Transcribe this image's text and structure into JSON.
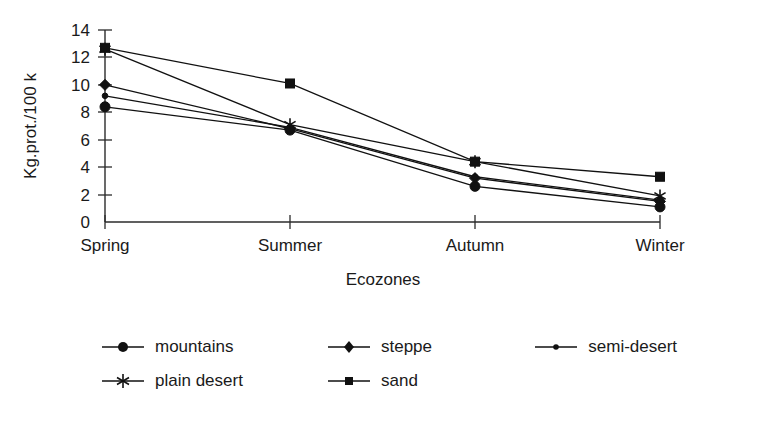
{
  "chart_data": {
    "type": "line",
    "title": "",
    "xlabel": "Ecozones",
    "ylabel": "Kg.prot./100 k",
    "categories": [
      "Spring",
      "Summer",
      "Autumn",
      "Winter"
    ],
    "ylim": [
      0,
      14
    ],
    "yticks": [
      0,
      2,
      4,
      6,
      8,
      10,
      12,
      14
    ],
    "ytick_labels": [
      "0",
      "2",
      "4",
      "6",
      "8",
      "10",
      "12",
      "14"
    ],
    "grid": false,
    "legend_position": "bottom",
    "series": [
      {
        "name": "mountains",
        "marker": "circle",
        "values": [
          8.4,
          6.7,
          2.6,
          1.1
        ]
      },
      {
        "name": "steppe",
        "marker": "diamond",
        "values": [
          10.0,
          6.8,
          3.2,
          1.5
        ]
      },
      {
        "name": "semi-desert",
        "marker": "dot",
        "values": [
          9.2,
          6.9,
          3.3,
          1.6
        ]
      },
      {
        "name": "plain desert",
        "marker": "asterisk",
        "values": [
          12.6,
          7.1,
          4.4,
          1.9
        ]
      },
      {
        "name": "sand",
        "marker": "square",
        "values": [
          12.7,
          10.1,
          4.4,
          3.3
        ]
      }
    ],
    "line_color": "#111111",
    "axis_color": "#2b2b2b"
  },
  "axes": {
    "y_title": "Kg.prot./100 k",
    "x_title": "Ecozones",
    "y_ticks": [
      "14",
      "12",
      "10",
      "8",
      "6",
      "4",
      "2",
      "0"
    ],
    "x_categories": [
      "Spring",
      "Summer",
      "Autumn",
      "Winter"
    ]
  },
  "legend": {
    "row1": [
      {
        "label": "mountains",
        "marker": "circle"
      },
      {
        "label": "steppe",
        "marker": "diamond"
      },
      {
        "label": "semi-desert",
        "marker": "dot"
      }
    ],
    "row2": [
      {
        "label": "plain desert",
        "marker": "asterisk"
      },
      {
        "label": "sand",
        "marker": "square"
      }
    ]
  }
}
